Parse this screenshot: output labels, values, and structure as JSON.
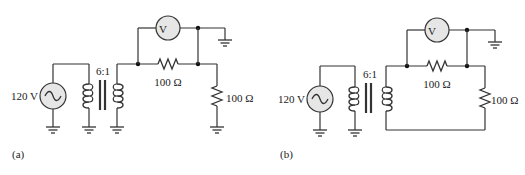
{
  "figure_a": {
    "label": "(a)",
    "source_voltage": "120 V",
    "transformer_ratio": "6:1",
    "series_resistor": "100 Ω",
    "load_resistor": "100 Ω",
    "meter_symbol": "V"
  },
  "figure_b": {
    "label": "(b)",
    "source_voltage": "120 V",
    "transformer_ratio": "6:1",
    "series_resistor": "100 Ω",
    "load_resistor": "100 Ω",
    "meter_symbol": "V"
  },
  "colors": {
    "wire": "#333333",
    "meter_fill": "#e6e6e6",
    "background": "#ffffff"
  }
}
